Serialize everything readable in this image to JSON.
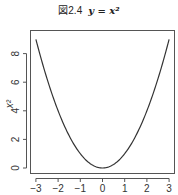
{
  "figure": {
    "label": "図2.4",
    "equation": "y = x²"
  },
  "chart_data": {
    "type": "line",
    "xlabel": "",
    "ylabel": "x²",
    "xlim": [
      -3,
      3
    ],
    "ylim": [
      0,
      9
    ],
    "x_ticks": [
      "-3",
      "-2",
      "-1",
      "0",
      "1",
      "2",
      "3"
    ],
    "y_ticks": [
      "0",
      "2",
      "4",
      "6",
      "8"
    ],
    "grid": false,
    "legend": null,
    "series": [
      {
        "name": "y = x^2",
        "color": "#333333",
        "x": [
          -3,
          -2.5,
          -2,
          -1.5,
          -1,
          -0.5,
          0,
          0.5,
          1,
          1.5,
          2,
          2.5,
          3
        ],
        "y": [
          9,
          6.25,
          4,
          2.25,
          1,
          0.25,
          0,
          0.25,
          1,
          2.25,
          4,
          6.25,
          9
        ]
      }
    ]
  },
  "axes": {
    "x_tick_labels": [
      "-3",
      "-2",
      "-1",
      "0",
      "1",
      "2",
      "3"
    ],
    "y_tick_labels": [
      "0",
      "2",
      "4",
      "6",
      "8"
    ],
    "ylabel": "x²"
  }
}
